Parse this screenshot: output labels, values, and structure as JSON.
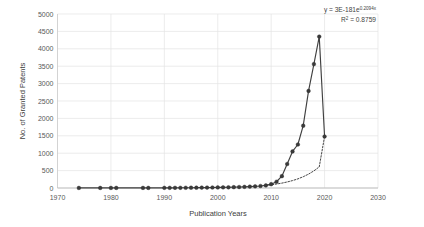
{
  "chart_data": {
    "type": "line",
    "title": "",
    "xlabel": "Publication Years",
    "ylabel": "No. of Granted Patents",
    "xlim": [
      1970,
      2030
    ],
    "ylim": [
      0,
      5000
    ],
    "xticks": [
      1970,
      1980,
      1990,
      2000,
      2010,
      2020,
      2030
    ],
    "yticks": [
      0,
      500,
      1000,
      1500,
      2000,
      2500,
      3000,
      3500,
      4000,
      4500,
      5000
    ],
    "grid": "horizontal",
    "legend": "none",
    "series": [
      {
        "name": "Granted Patents",
        "style": "line-with-markers",
        "color": "#3a3a3a",
        "x": [
          1974,
          1978,
          1980,
          1981,
          1986,
          1987,
          1990,
          1991,
          1992,
          1993,
          1994,
          1995,
          1996,
          1997,
          1998,
          1999,
          2000,
          2001,
          2002,
          2003,
          2004,
          2005,
          2006,
          2007,
          2008,
          2009,
          2010,
          2011,
          2012,
          2013,
          2014,
          2015,
          2016,
          2017,
          2018,
          2019,
          2020
        ],
        "values": [
          2,
          2,
          2,
          3,
          3,
          3,
          4,
          5,
          5,
          6,
          7,
          8,
          9,
          11,
          12,
          14,
          16,
          18,
          20,
          24,
          28,
          33,
          40,
          48,
          58,
          75,
          110,
          180,
          340,
          690,
          1050,
          1250,
          1790,
          2790,
          3560,
          4350,
          1480
        ]
      },
      {
        "name": "Exponential trendline",
        "style": "dotted",
        "color": "#3a3a3a",
        "x": [
          2009,
          2010,
          2011,
          2012,
          2013,
          2014,
          2015,
          2016,
          2017,
          2018,
          2019,
          2020
        ],
        "values": [
          75,
          92,
          114,
          140,
          173,
          213,
          262,
          324,
          399,
          492,
          607,
          1480
        ]
      }
    ],
    "annotations": [
      {
        "name": "trendline-equation",
        "text_prefix": "y = 3E-181e",
        "text_sup": "0.2094x",
        "text": "y = 3E-181e0.2094x"
      },
      {
        "name": "r-squared",
        "text_prefix": "R",
        "text_sup": "2",
        "text_suffix": " = 0.8759",
        "text": "R2 = 0.8759"
      }
    ]
  },
  "axis": {
    "y_title": "No. of Granted Patents",
    "x_title": "Publication Years",
    "y_labels": [
      "5000",
      "4500",
      "4000",
      "3500",
      "3000",
      "2500",
      "2000",
      "1500",
      "1000",
      "500",
      "0"
    ],
    "x_labels": [
      "1970",
      "1980",
      "1990",
      "2000",
      "2010",
      "2020",
      "2030"
    ]
  },
  "annotation": {
    "equation_prefix": "y = 3E-181e",
    "equation_exponent": "0.2094x",
    "r2_prefix": "R",
    "r2_sup": "2",
    "r2_value": " = 0.8759"
  },
  "colors": {
    "series": "#3a3a3a",
    "grid": "#e4e4e4",
    "axis": "#c8c8c8",
    "background": "#ffffff",
    "text": "#595959"
  }
}
